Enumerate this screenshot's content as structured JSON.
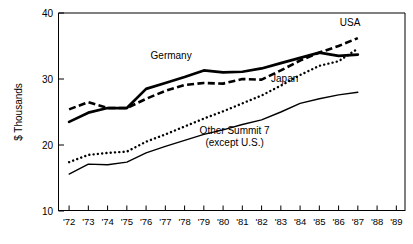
{
  "chart_data": {
    "type": "line",
    "title": "",
    "xlabel": "",
    "ylabel": "$ Thousands",
    "ylim": [
      10,
      40
    ],
    "yticks": [
      10,
      20,
      30,
      40
    ],
    "ytick_labels": [
      "10",
      "20",
      "30",
      "40"
    ],
    "grid": false,
    "legend_position": "inline-annotations",
    "x": [
      1972,
      1973,
      1974,
      1975,
      1976,
      1977,
      1978,
      1979,
      1980,
      1981,
      1982,
      1983,
      1984,
      1985,
      1986,
      1987
    ],
    "categories": [
      "'72",
      "'73",
      "'74",
      "'75",
      "'76",
      "'77",
      "'78",
      "'79",
      "'80",
      "'81",
      "'82",
      "'83",
      "'84",
      "'85",
      "'86",
      "'87"
    ],
    "xtick_labels": [
      "'72",
      "'73",
      "'74",
      "'75",
      "'76",
      "'77",
      "'78",
      "'79",
      "'80",
      "'81",
      "'82",
      "'83",
      "'84",
      "'85",
      "'86",
      "'87",
      "'88",
      "'89"
    ],
    "xlim_labels": [
      "'72",
      "'89"
    ],
    "series": [
      {
        "name": "USA",
        "style": "dashed",
        "label": "USA",
        "label_x": 1986.6,
        "label_y": 38.0,
        "values": [
          25.4,
          26.5,
          25.6,
          25.6,
          27.0,
          28.2,
          29.1,
          29.4,
          29.3,
          30.0,
          29.9,
          31.3,
          32.8,
          34.0,
          35.0,
          36.2
        ]
      },
      {
        "name": "Germany",
        "style": "thick-solid",
        "label": "Germany",
        "label_x": 1977.3,
        "label_y": 33.1,
        "values": [
          23.5,
          24.9,
          25.6,
          25.6,
          28.5,
          29.4,
          30.3,
          31.3,
          31.0,
          31.1,
          31.6,
          32.4,
          33.2,
          34.0,
          33.5,
          33.7
        ]
      },
      {
        "name": "Japan",
        "style": "dotted",
        "label": "Japan",
        "label_x": 1983.2,
        "label_y": 29.6,
        "values": [
          17.4,
          18.5,
          18.8,
          19.0,
          20.5,
          21.6,
          22.8,
          24.0,
          25.1,
          26.3,
          27.5,
          29.0,
          30.6,
          32.0,
          32.7,
          34.6
        ]
      },
      {
        "name": "Other Summit 7 (except U.S.)",
        "style": "thin-solid",
        "label_line1": "Other Summit 7",
        "label_line2": "(except U.S.)",
        "label_x": 1980.6,
        "label_y": 21.6,
        "values": [
          15.6,
          17.1,
          17.0,
          17.4,
          18.8,
          19.8,
          20.7,
          21.6,
          22.3,
          23.1,
          23.8,
          25.0,
          26.3,
          27.0,
          27.6,
          28.0
        ]
      }
    ]
  },
  "colors": {
    "ink": "#000000",
    "background": "#ffffff"
  }
}
